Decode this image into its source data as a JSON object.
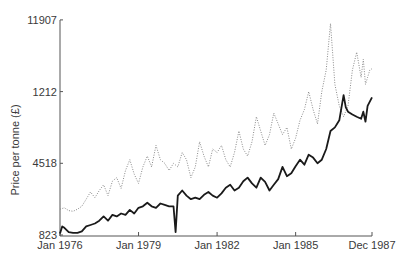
{
  "chart_data": {
    "type": "line",
    "title": "",
    "xlabel": "",
    "ylabel": "Price per tonne (£)",
    "yticks": [
      {
        "label": "823",
        "pos": 0
      },
      {
        "label": "4518",
        "pos": 1
      },
      {
        "label": "1212",
        "pos": 2
      },
      {
        "label": "11907",
        "pos": 3
      }
    ],
    "xticks": [
      {
        "label": "Jan 1976",
        "t": 0
      },
      {
        "label": "Jan 1979",
        "t": 36
      },
      {
        "label": "Jan 1982",
        "t": 72
      },
      {
        "label": "Jan 1985",
        "t": 108
      },
      {
        "label": "Dec 1987",
        "t": 143
      }
    ],
    "grid": false,
    "legend": null,
    "xrange": [
      0,
      143
    ],
    "yrange_ticks": [
      0,
      3
    ],
    "series": [
      {
        "name": "dotted series",
        "style": "dotted",
        "color": "#8a8a8a",
        "points": [
          [
            0,
            0.36
          ],
          [
            2,
            0.38
          ],
          [
            4,
            0.34
          ],
          [
            6,
            0.33
          ],
          [
            8,
            0.36
          ],
          [
            10,
            0.4
          ],
          [
            12,
            0.5
          ],
          [
            14,
            0.6
          ],
          [
            16,
            0.52
          ],
          [
            18,
            0.62
          ],
          [
            20,
            0.7
          ],
          [
            22,
            0.55
          ],
          [
            24,
            0.75
          ],
          [
            26,
            0.8
          ],
          [
            28,
            0.65
          ],
          [
            30,
            0.9
          ],
          [
            32,
            1.05
          ],
          [
            34,
            0.85
          ],
          [
            36,
            0.72
          ],
          [
            38,
            0.95
          ],
          [
            40,
            1.1
          ],
          [
            42,
            0.95
          ],
          [
            44,
            1.25
          ],
          [
            46,
            1.05
          ],
          [
            48,
            1.0
          ],
          [
            50,
            0.9
          ],
          [
            52,
            1.0
          ],
          [
            54,
            0.95
          ],
          [
            56,
            1.15
          ],
          [
            58,
            1.05
          ],
          [
            60,
            0.8
          ],
          [
            62,
            0.95
          ],
          [
            64,
            1.3
          ],
          [
            66,
            1.1
          ],
          [
            68,
            0.95
          ],
          [
            70,
            1.2
          ],
          [
            72,
            1.15
          ],
          [
            74,
            1.25
          ],
          [
            76,
            1.05
          ],
          [
            78,
            0.95
          ],
          [
            80,
            1.15
          ],
          [
            82,
            1.45
          ],
          [
            84,
            1.2
          ],
          [
            86,
            1.1
          ],
          [
            88,
            1.3
          ],
          [
            90,
            1.65
          ],
          [
            92,
            1.45
          ],
          [
            94,
            1.25
          ],
          [
            96,
            1.4
          ],
          [
            98,
            1.7
          ],
          [
            100,
            1.55
          ],
          [
            102,
            1.4
          ],
          [
            104,
            1.5
          ],
          [
            106,
            1.2
          ],
          [
            108,
            1.35
          ],
          [
            110,
            1.6
          ],
          [
            112,
            1.75
          ],
          [
            114,
            2.0
          ],
          [
            116,
            1.75
          ],
          [
            118,
            1.55
          ],
          [
            120,
            2.0
          ],
          [
            122,
            2.3
          ],
          [
            124,
            2.95
          ],
          [
            126,
            2.1
          ],
          [
            128,
            1.8
          ],
          [
            130,
            1.65
          ],
          [
            132,
            1.8
          ],
          [
            134,
            2.3
          ],
          [
            136,
            2.55
          ],
          [
            138,
            2.2
          ],
          [
            139,
            2.45
          ],
          [
            140,
            2.1
          ],
          [
            141,
            2.2
          ],
          [
            142,
            2.3
          ],
          [
            143,
            2.32
          ]
        ]
      },
      {
        "name": "solid series",
        "style": "solid",
        "color": "#1a1a1a",
        "points": [
          [
            0,
            0.02
          ],
          [
            1,
            0.12
          ],
          [
            2,
            0.1
          ],
          [
            4,
            0.04
          ],
          [
            6,
            0.03
          ],
          [
            8,
            0.03
          ],
          [
            10,
            0.05
          ],
          [
            12,
            0.12
          ],
          [
            14,
            0.14
          ],
          [
            16,
            0.16
          ],
          [
            18,
            0.2
          ],
          [
            20,
            0.26
          ],
          [
            22,
            0.2
          ],
          [
            24,
            0.28
          ],
          [
            26,
            0.26
          ],
          [
            28,
            0.3
          ],
          [
            30,
            0.28
          ],
          [
            32,
            0.35
          ],
          [
            34,
            0.3
          ],
          [
            36,
            0.38
          ],
          [
            38,
            0.4
          ],
          [
            40,
            0.45
          ],
          [
            42,
            0.4
          ],
          [
            44,
            0.38
          ],
          [
            46,
            0.44
          ],
          [
            48,
            0.42
          ],
          [
            50,
            0.4
          ],
          [
            52,
            0.4
          ],
          [
            53,
            0.04
          ],
          [
            54,
            0.55
          ],
          [
            56,
            0.62
          ],
          [
            58,
            0.55
          ],
          [
            60,
            0.5
          ],
          [
            62,
            0.52
          ],
          [
            64,
            0.5
          ],
          [
            66,
            0.56
          ],
          [
            68,
            0.6
          ],
          [
            70,
            0.55
          ],
          [
            72,
            0.52
          ],
          [
            74,
            0.58
          ],
          [
            76,
            0.66
          ],
          [
            78,
            0.7
          ],
          [
            80,
            0.62
          ],
          [
            82,
            0.66
          ],
          [
            84,
            0.75
          ],
          [
            86,
            0.8
          ],
          [
            88,
            0.72
          ],
          [
            90,
            0.66
          ],
          [
            92,
            0.8
          ],
          [
            94,
            0.74
          ],
          [
            96,
            0.62
          ],
          [
            98,
            0.7
          ],
          [
            100,
            0.78
          ],
          [
            102,
            0.95
          ],
          [
            104,
            0.82
          ],
          [
            106,
            0.86
          ],
          [
            108,
            0.96
          ],
          [
            110,
            1.05
          ],
          [
            112,
            0.98
          ],
          [
            114,
            1.12
          ],
          [
            116,
            1.08
          ],
          [
            118,
            1.0
          ],
          [
            120,
            1.05
          ],
          [
            122,
            1.2
          ],
          [
            124,
            1.45
          ],
          [
            126,
            1.5
          ],
          [
            128,
            1.6
          ],
          [
            130,
            1.95
          ],
          [
            131,
            1.78
          ],
          [
            132,
            1.72
          ],
          [
            134,
            1.68
          ],
          [
            136,
            1.65
          ],
          [
            138,
            1.62
          ],
          [
            139,
            1.72
          ],
          [
            140,
            1.58
          ],
          [
            141,
            1.8
          ],
          [
            143,
            1.92
          ]
        ]
      }
    ]
  },
  "layout_px": {
    "x0": 60,
    "x1": 372,
    "y_bottom": 235,
    "tick_spacing": 71.7
  }
}
